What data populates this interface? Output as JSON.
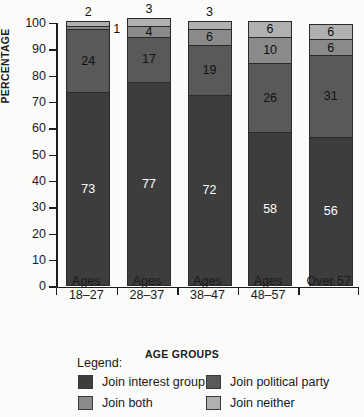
{
  "chart_data": {
    "type": "bar",
    "stacked": true,
    "title": "",
    "xlabel": "AGE GROUPS",
    "ylabel": "PERCENTAGE",
    "ylim": [
      0,
      100
    ],
    "ytick_step": 10,
    "yticks": [
      0,
      10,
      20,
      30,
      40,
      50,
      60,
      70,
      80,
      90,
      100
    ],
    "grid": false,
    "legend_position": "bottom",
    "legend_title": "Legend:",
    "categories": [
      "Ages 18–27",
      "Ages 28–37",
      "Ages 38–47",
      "Ages 48–57",
      "Over 57"
    ],
    "category_lines": [
      [
        "Ages",
        "18–27"
      ],
      [
        "Ages",
        "28–37"
      ],
      [
        "Ages",
        "38–47"
      ],
      [
        "Ages",
        "48–57"
      ],
      [
        "Over 57",
        ""
      ]
    ],
    "series": [
      {
        "name": "Join interest group",
        "color": "#3d3d3d",
        "values": [
          73,
          77,
          72,
          58,
          56
        ],
        "label_color": [
          "light",
          "light",
          "light",
          "light",
          "light"
        ],
        "label_pos": [
          "inside",
          "inside",
          "inside",
          "inside",
          "inside"
        ]
      },
      {
        "name": "Join political party",
        "color": "#595959",
        "values": [
          24,
          17,
          19,
          26,
          31
        ],
        "label_color": [
          "dark",
          "dark",
          "dark",
          "dark",
          "dark"
        ],
        "label_pos": [
          "inside",
          "inside",
          "inside",
          "inside",
          "inside"
        ]
      },
      {
        "name": "Join both",
        "color": "#8a8a8a",
        "values": [
          1,
          4,
          6,
          10,
          6
        ],
        "label_color": [
          "dark",
          "dark",
          "dark",
          "dark",
          "dark"
        ],
        "label_pos": [
          "outside-right",
          "inside",
          "inside",
          "inside",
          "inside"
        ]
      },
      {
        "name": "Join neither",
        "color": "#b0b0b0",
        "values": [
          2,
          3,
          3,
          6,
          6
        ],
        "label_color": [
          "dark",
          "dark",
          "dark",
          "dark",
          "dark"
        ],
        "label_pos": [
          "outside-top",
          "outside-top",
          "outside-top",
          "inside",
          "inside"
        ]
      }
    ]
  }
}
